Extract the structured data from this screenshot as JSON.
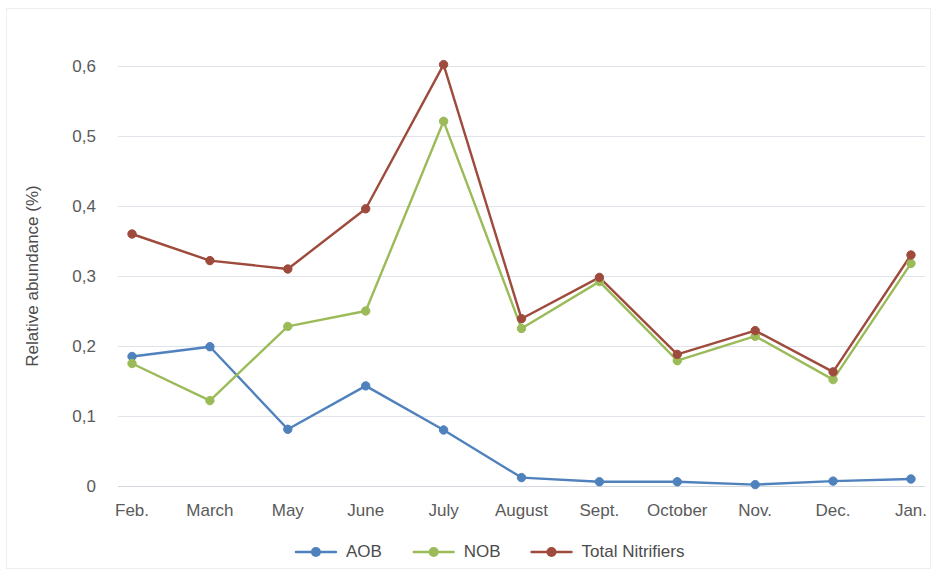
{
  "chart_data": {
    "type": "line",
    "title": "",
    "xlabel": "",
    "ylabel": "Relative abundance (%)",
    "categories": [
      "Feb.",
      "March",
      "May",
      "June",
      "July",
      "August",
      "Sept.",
      "October",
      "Nov.",
      "Dec.",
      "Jan."
    ],
    "ylim": [
      0,
      0.62
    ],
    "yticks": [
      0,
      0.1,
      0.2,
      0.3,
      0.4,
      0.5,
      0.6
    ],
    "ytick_labels": [
      "0",
      "0,1",
      "0,2",
      "0,3",
      "0,4",
      "0,5",
      "0,6"
    ],
    "grid": "horizontal",
    "legend_position": "bottom",
    "decimal_separator": ",",
    "markers": "circle",
    "series": [
      {
        "name": "AOB",
        "color": "#4F81BD",
        "values": [
          0.185,
          0.199,
          0.081,
          0.143,
          0.08,
          0.012,
          0.006,
          0.006,
          0.002,
          0.007,
          0.01
        ]
      },
      {
        "name": "NOB",
        "color": "#9BBB59",
        "values": [
          0.175,
          0.122,
          0.228,
          0.25,
          0.521,
          0.225,
          0.292,
          0.179,
          0.214,
          0.152,
          0.318
        ]
      },
      {
        "name": "Total Nitrifiers",
        "color": "#9E4A3C",
        "values": [
          0.36,
          0.322,
          0.31,
          0.396,
          0.602,
          0.239,
          0.298,
          0.188,
          0.222,
          0.163,
          0.33
        ]
      }
    ]
  },
  "legend": {
    "items": [
      {
        "label": "AOB",
        "color": "#4F81BD"
      },
      {
        "label": "NOB",
        "color": "#9BBB59"
      },
      {
        "label": "Total Nitrifiers",
        "color": "#9E4A3C"
      }
    ]
  },
  "axes": {
    "y_title": "Relative abundance (%)"
  },
  "colors": {
    "aob": "#4F81BD",
    "nob": "#9BBB59",
    "total_nitrifiers": "#9E4A3C",
    "gridline": "#dfe4ea",
    "text": "#5a5a5a",
    "background": "#ffffff"
  }
}
